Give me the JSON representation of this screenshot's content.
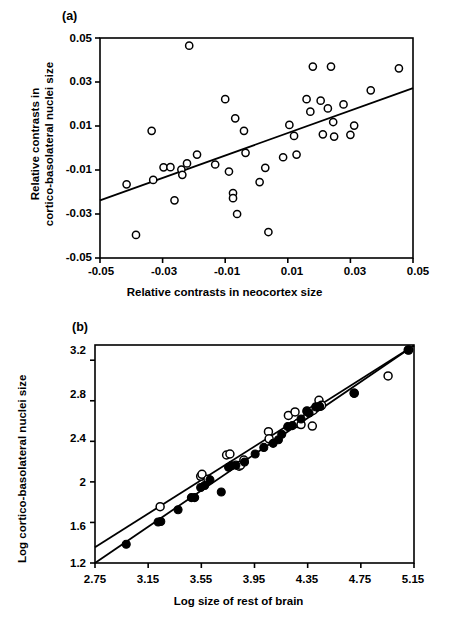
{
  "figure": {
    "panels": [
      {
        "id": "a",
        "label": "(a)"
      },
      {
        "id": "b",
        "label": "(b)"
      }
    ]
  },
  "chart_data": [
    {
      "type": "scatter",
      "panel": "(a)",
      "title": "",
      "xlabel": "Relative contrasts in neocortex size",
      "ylabel": "Relative contrasts in cortico-basolateral nuclei size",
      "ylabel_lines": [
        "Relative contrasts in",
        "cortico-basolateral nuclei size"
      ],
      "xlim": [
        -0.05,
        0.05
      ],
      "ylim": [
        -0.05,
        0.05
      ],
      "xticks": [
        -0.05,
        -0.03,
        -0.01,
        0.01,
        0.03,
        0.05
      ],
      "xticklabels": [
        "-0.05",
        "-0.03",
        "-0.01",
        "0.01",
        "0.03",
        "0.05"
      ],
      "yticks": [
        -0.05,
        -0.03,
        -0.01,
        0.01,
        0.03,
        0.05
      ],
      "yticklabels": [
        "-0.05",
        "-0.03",
        "-0.01",
        "0.01",
        "0.03",
        "0.05"
      ],
      "grid": false,
      "legend": "none",
      "marker": "open-circle",
      "points": [
        {
          "x": -0.0415,
          "y": -0.0165
        },
        {
          "x": -0.0385,
          "y": -0.0395
        },
        {
          "x": -0.0335,
          "y": 0.0078
        },
        {
          "x": -0.033,
          "y": -0.0145
        },
        {
          "x": -0.0297,
          "y": -0.0088
        },
        {
          "x": -0.0275,
          "y": -0.0087
        },
        {
          "x": -0.0262,
          "y": -0.0238
        },
        {
          "x": -0.024,
          "y": -0.0098
        },
        {
          "x": -0.0237,
          "y": -0.0122
        },
        {
          "x": -0.0222,
          "y": -0.007
        },
        {
          "x": -0.0215,
          "y": 0.0465
        },
        {
          "x": -0.019,
          "y": -0.003
        },
        {
          "x": -0.0132,
          "y": -0.0075
        },
        {
          "x": -0.01,
          "y": 0.0222
        },
        {
          "x": -0.0088,
          "y": -0.0107
        },
        {
          "x": -0.0075,
          "y": -0.0205
        },
        {
          "x": -0.0075,
          "y": -0.0228
        },
        {
          "x": -0.0068,
          "y": 0.0135
        },
        {
          "x": -0.0062,
          "y": -0.03
        },
        {
          "x": -0.004,
          "y": 0.0078
        },
        {
          "x": -0.0035,
          "y": -0.0022
        },
        {
          "x": 0.001,
          "y": -0.0155
        },
        {
          "x": 0.0028,
          "y": -0.009
        },
        {
          "x": 0.0038,
          "y": -0.0382
        },
        {
          "x": 0.0085,
          "y": -0.0042
        },
        {
          "x": 0.0105,
          "y": 0.0105
        },
        {
          "x": 0.012,
          "y": 0.0055
        },
        {
          "x": 0.0128,
          "y": -0.003
        },
        {
          "x": 0.016,
          "y": 0.0222
        },
        {
          "x": 0.0172,
          "y": 0.0165
        },
        {
          "x": 0.018,
          "y": 0.037
        },
        {
          "x": 0.0205,
          "y": 0.0215
        },
        {
          "x": 0.0212,
          "y": 0.0062
        },
        {
          "x": 0.0228,
          "y": 0.018
        },
        {
          "x": 0.0238,
          "y": 0.037
        },
        {
          "x": 0.0245,
          "y": 0.0118
        },
        {
          "x": 0.0248,
          "y": 0.0052
        },
        {
          "x": 0.0278,
          "y": 0.0198
        },
        {
          "x": 0.03,
          "y": 0.006
        },
        {
          "x": 0.0312,
          "y": 0.0102
        },
        {
          "x": 0.0365,
          "y": 0.0262
        },
        {
          "x": 0.0455,
          "y": 0.0362
        }
      ],
      "fit_line": {
        "x1": -0.05,
        "y1": -0.0238,
        "x2": 0.05,
        "y2": 0.0272
      }
    },
    {
      "type": "scatter",
      "panel": "(b)",
      "title": "",
      "xlabel": "Log size of rest of brain",
      "ylabel": "Log cortico-basolateral nuclei size",
      "xlim": [
        2.75,
        5.15
      ],
      "ylim": [
        1.2,
        3.35
      ],
      "xticks": [
        2.75,
        3.15,
        3.55,
        3.95,
        4.35,
        4.75,
        5.15
      ],
      "xticklabels": [
        "2.75",
        "3.15",
        "3.55",
        "3.95",
        "4.35",
        "4.75",
        "5.15"
      ],
      "yticks": [
        1.2,
        1.6,
        2.0,
        2.4,
        2.8,
        3.2
      ],
      "yticklabels": [
        "1.2",
        "1.6",
        "2",
        "2.4",
        "2.8",
        "3.2"
      ],
      "grid": false,
      "legend": "none",
      "series": [
        {
          "name": "open",
          "marker": "open-circle",
          "points": [
            {
              "x": 3.24,
              "y": 1.755
            },
            {
              "x": 3.545,
              "y": 2.055
            },
            {
              "x": 3.555,
              "y": 2.075
            },
            {
              "x": 3.6,
              "y": 2.025
            },
            {
              "x": 3.74,
              "y": 2.265
            },
            {
              "x": 3.765,
              "y": 2.275
            },
            {
              "x": 3.835,
              "y": 2.155
            },
            {
              "x": 3.845,
              "y": 2.165
            },
            {
              "x": 3.87,
              "y": 2.215
            },
            {
              "x": 4.055,
              "y": 2.495
            },
            {
              "x": 4.06,
              "y": 2.425
            },
            {
              "x": 4.205,
              "y": 2.655
            },
            {
              "x": 4.255,
              "y": 2.69
            },
            {
              "x": 4.275,
              "y": 2.575
            },
            {
              "x": 4.3,
              "y": 2.565
            },
            {
              "x": 4.345,
              "y": 2.7
            },
            {
              "x": 4.365,
              "y": 2.685
            },
            {
              "x": 4.385,
              "y": 2.55
            },
            {
              "x": 4.39,
              "y": 2.705
            },
            {
              "x": 4.435,
              "y": 2.805
            },
            {
              "x": 4.445,
              "y": 2.745
            },
            {
              "x": 4.455,
              "y": 2.755
            },
            {
              "x": 4.7,
              "y": 2.875
            },
            {
              "x": 4.955,
              "y": 3.045
            },
            {
              "x": 5.11,
              "y": 3.3
            }
          ],
          "fit_line": {
            "x1": 2.75,
            "y1": 1.355,
            "x2": 5.15,
            "y2": 3.345
          }
        },
        {
          "name": "filled",
          "marker": "filled-circle",
          "points": [
            {
              "x": 2.985,
              "y": 1.385
            },
            {
              "x": 3.225,
              "y": 1.605
            },
            {
              "x": 3.245,
              "y": 1.61
            },
            {
              "x": 3.375,
              "y": 1.725
            },
            {
              "x": 3.475,
              "y": 1.845
            },
            {
              "x": 3.5,
              "y": 1.845
            },
            {
              "x": 3.545,
              "y": 1.945
            },
            {
              "x": 3.575,
              "y": 1.965
            },
            {
              "x": 3.615,
              "y": 2.02
            },
            {
              "x": 3.7,
              "y": 1.9
            },
            {
              "x": 3.755,
              "y": 2.145
            },
            {
              "x": 3.775,
              "y": 2.16
            },
            {
              "x": 3.81,
              "y": 2.165
            },
            {
              "x": 3.875,
              "y": 2.195
            },
            {
              "x": 3.955,
              "y": 2.275
            },
            {
              "x": 4.02,
              "y": 2.34
            },
            {
              "x": 4.09,
              "y": 2.38
            },
            {
              "x": 4.13,
              "y": 2.415
            },
            {
              "x": 4.155,
              "y": 2.47
            },
            {
              "x": 4.2,
              "y": 2.545
            },
            {
              "x": 4.235,
              "y": 2.555
            },
            {
              "x": 4.3,
              "y": 2.62
            },
            {
              "x": 4.345,
              "y": 2.695
            },
            {
              "x": 4.36,
              "y": 2.68
            },
            {
              "x": 4.41,
              "y": 2.74
            },
            {
              "x": 4.44,
              "y": 2.745
            },
            {
              "x": 4.7,
              "y": 2.875
            },
            {
              "x": 5.105,
              "y": 3.3
            }
          ],
          "fit_line": {
            "x1": 2.75,
            "y1": 1.2,
            "x2": 5.15,
            "y2": 3.345
          }
        }
      ]
    }
  ]
}
